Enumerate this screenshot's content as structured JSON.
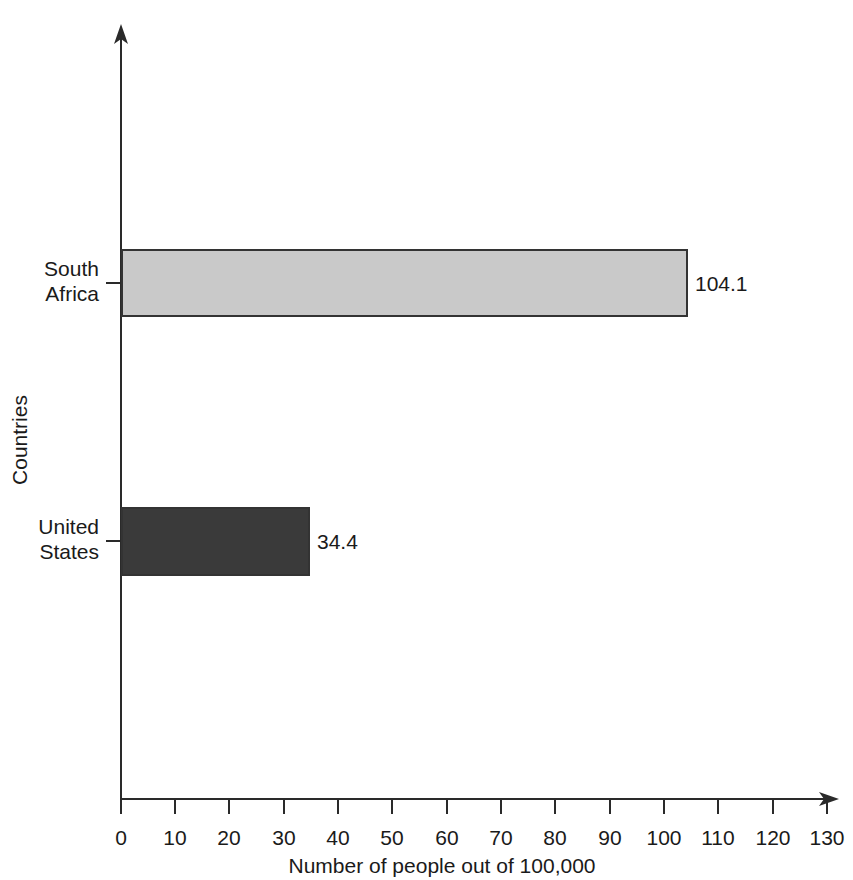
{
  "chart_data": {
    "type": "bar",
    "orientation": "horizontal",
    "title": "",
    "xlabel": "Number of people out of 100,000",
    "ylabel": "Countries",
    "categories": [
      "South Africa",
      "United States"
    ],
    "values": [
      104.1,
      34.4
    ],
    "value_labels": [
      "104.1",
      "34.4"
    ],
    "bar_colors": [
      "#c9c9c9",
      "#3a3a3a"
    ],
    "bar_border_color": "#333333",
    "xlim": [
      0,
      130
    ],
    "xticks": [
      0,
      10,
      20,
      30,
      40,
      50,
      60,
      70,
      80,
      90,
      100,
      110,
      120,
      130
    ],
    "xtick_labels": [
      "0",
      "10",
      "20",
      "30",
      "40",
      "50",
      "60",
      "70",
      "80",
      "90",
      "100",
      "110",
      "120",
      "130"
    ],
    "grid": false,
    "legend": false,
    "axis_color": "#2a2a2a",
    "background": "#ffffff"
  },
  "category_label_lines": [
    [
      "South",
      "Africa"
    ],
    [
      "United",
      "States"
    ]
  ]
}
